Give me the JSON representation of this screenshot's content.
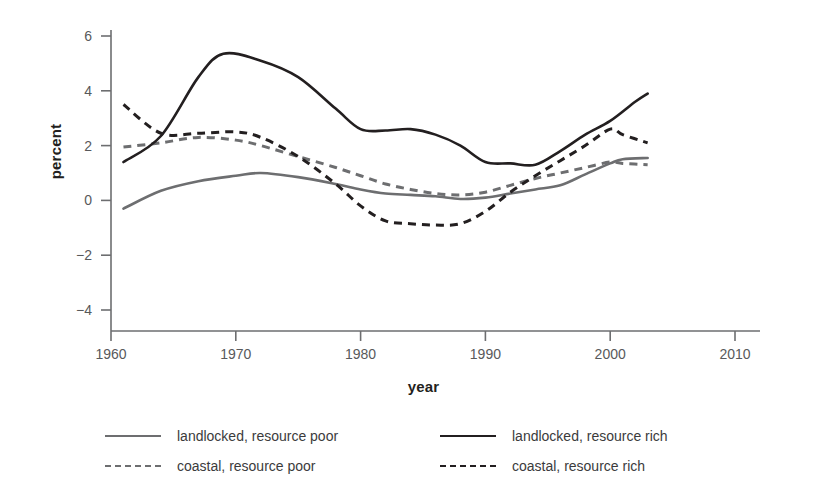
{
  "chart_data": {
    "type": "line",
    "title": "",
    "xlabel": "year",
    "ylabel": "percent",
    "xlim": [
      1960,
      2010
    ],
    "ylim": [
      -4,
      6
    ],
    "xticks": [
      "1960",
      "1970",
      "1980",
      "1990",
      "2000",
      "2010"
    ],
    "yticks": [
      "6",
      "4",
      "2",
      "0",
      "−2",
      "−4"
    ],
    "grid": false,
    "legend_position": "below-plot",
    "series": [
      {
        "name": "landlocked, resource poor",
        "style": "solid",
        "color": "#6d6e70",
        "x": [
          1961,
          1964,
          1967,
          1970,
          1972,
          1975,
          1978,
          1980,
          1982,
          1984,
          1986,
          1988,
          1990,
          1992,
          1994,
          1996,
          1998,
          2000,
          2001,
          2003
        ],
        "values": [
          -0.3,
          0.35,
          0.7,
          0.9,
          1.0,
          0.85,
          0.6,
          0.4,
          0.25,
          0.2,
          0.15,
          0.05,
          0.1,
          0.25,
          0.4,
          0.55,
          0.95,
          1.35,
          1.5,
          1.55
        ]
      },
      {
        "name": "coastal, resource poor",
        "style": "dashed",
        "color": "#6d6e70",
        "x": [
          1961,
          1964,
          1967,
          1970,
          1972,
          1975,
          1978,
          1980,
          1982,
          1984,
          1986,
          1988,
          1990,
          1992,
          1994,
          1996,
          1998,
          2000,
          2001,
          2003
        ],
        "values": [
          1.95,
          2.1,
          2.3,
          2.2,
          2.0,
          1.6,
          1.2,
          0.9,
          0.6,
          0.4,
          0.25,
          0.2,
          0.3,
          0.55,
          0.8,
          1.0,
          1.2,
          1.4,
          1.35,
          1.3
        ]
      },
      {
        "name": "landlocked, resource rich",
        "style": "solid",
        "color": "#231f20",
        "x": [
          1961,
          1964,
          1967,
          1969,
          1972,
          1975,
          1978,
          1980,
          1982,
          1984,
          1986,
          1988,
          1990,
          1992,
          1994,
          1996,
          1998,
          2000,
          2002,
          2003
        ],
        "values": [
          1.4,
          2.35,
          4.5,
          5.35,
          5.1,
          4.5,
          3.35,
          2.6,
          2.55,
          2.6,
          2.4,
          2.0,
          1.4,
          1.35,
          1.3,
          1.8,
          2.4,
          2.9,
          3.6,
          3.9
        ]
      },
      {
        "name": "coastal, resource rich",
        "style": "dashed",
        "color": "#231f20",
        "x": [
          1961,
          1964,
          1967,
          1970,
          1972,
          1975,
          1978,
          1980,
          1982,
          1984,
          1986,
          1988,
          1990,
          1992,
          1994,
          1996,
          1998,
          2000,
          2001,
          2003
        ],
        "values": [
          3.5,
          2.45,
          2.45,
          2.5,
          2.3,
          1.6,
          0.6,
          -0.2,
          -0.75,
          -0.85,
          -0.9,
          -0.85,
          -0.4,
          0.3,
          0.9,
          1.45,
          2.0,
          2.6,
          2.4,
          2.1
        ]
      }
    ]
  },
  "axes": {
    "y_title": "percent",
    "x_title": "year",
    "y_ticks": [
      {
        "label": "6",
        "value": 6
      },
      {
        "label": "4",
        "value": 4
      },
      {
        "label": "2",
        "value": 2
      },
      {
        "label": "0",
        "value": 0
      },
      {
        "label": "−2",
        "value": -2
      },
      {
        "label": "−4",
        "value": -4
      }
    ],
    "x_ticks": [
      {
        "label": "1960",
        "value": 1960
      },
      {
        "label": "1970",
        "value": 1970
      },
      {
        "label": "1980",
        "value": 1980
      },
      {
        "label": "1990",
        "value": 1990
      },
      {
        "label": "2000",
        "value": 2000
      },
      {
        "label": "2010",
        "value": 2010
      }
    ]
  },
  "legend": {
    "entries": [
      {
        "label": "landlocked, resource poor",
        "style": "solid",
        "color": "#6d6e70",
        "col": 0,
        "row": 0
      },
      {
        "label": "coastal, resource poor",
        "style": "dashed",
        "color": "#6d6e70",
        "col": 0,
        "row": 1
      },
      {
        "label": "landlocked, resource rich",
        "style": "solid",
        "color": "#231f20",
        "col": 1,
        "row": 0
      },
      {
        "label": "coastal, resource rich",
        "style": "dashed",
        "color": "#231f20",
        "col": 1,
        "row": 1
      }
    ]
  },
  "colors": {
    "poor": "#6d6e70",
    "rich": "#231f20",
    "axis": "#6d6e70",
    "tick_text": "#58595b",
    "background": "#ffffff"
  }
}
